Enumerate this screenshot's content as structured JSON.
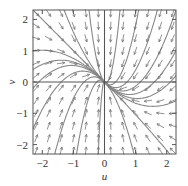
{
  "chart_data": {
    "type": "vector_field",
    "title": "",
    "xlabel": "u",
    "ylabel": "v",
    "xlim": [
      -2.3,
      2.3
    ],
    "ylim": [
      -2.3,
      2.3
    ],
    "xticks": [
      -2,
      -1,
      0,
      1,
      2
    ],
    "yticks": [
      -2,
      -1,
      0,
      1,
      2
    ],
    "xtick_labels": [
      "−2",
      "−1",
      "0",
      "1",
      "2"
    ],
    "ytick_labels": [
      "−2",
      "−1",
      "0",
      "1",
      "2"
    ],
    "grid": false,
    "system": {
      "du": "-u",
      "dv": "-u - 2v",
      "coeffs": {
        "a": -1,
        "b": 0,
        "c": -1,
        "d": -2
      }
    },
    "equilibrium": [
      0,
      0
    ],
    "equilibrium_type": "stable node",
    "arrow_grid_step": 0.4,
    "trajectory_starts": [
      [
        -2.3,
        2.3
      ],
      [
        -2.3,
        1.0
      ],
      [
        -2.3,
        0.4
      ],
      [
        -2.3,
        -0.2
      ],
      [
        -2.3,
        -1.5
      ],
      [
        -1.6,
        -2.3
      ],
      [
        -0.9,
        -2.3
      ],
      [
        -0.2,
        -2.3
      ],
      [
        0.0,
        2.3
      ],
      [
        0.0,
        -2.3
      ],
      [
        0.5,
        2.3
      ],
      [
        1.1,
        2.3
      ],
      [
        1.7,
        2.3
      ],
      [
        2.3,
        2.3
      ],
      [
        2.3,
        1.0
      ],
      [
        2.3,
        0.2
      ],
      [
        2.3,
        -0.6
      ],
      [
        0.95,
        -2.3
      ],
      [
        2.1,
        -2.3
      ],
      [
        -1.3,
        2.3
      ],
      [
        -0.5,
        2.3
      ]
    ],
    "colors": {
      "frame": "#555555",
      "trajectory": "#888888",
      "arrow": "#777777"
    }
  }
}
